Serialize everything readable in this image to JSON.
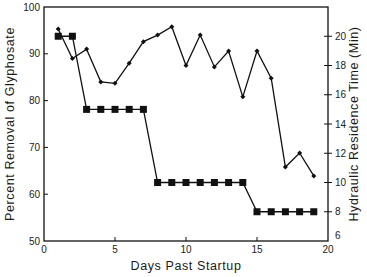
{
  "chart_data": {
    "type": "line",
    "title": "",
    "xlabel": "Days Past Startup",
    "ylabel": "Percent Removal of Glyphosate",
    "y2label": "Hydraulic Residence Time (Min)",
    "xlim": [
      0,
      20
    ],
    "ylim": [
      50,
      100
    ],
    "y2lim": [
      6,
      22
    ],
    "x_ticks": [
      0,
      5,
      10,
      15,
      20
    ],
    "y_ticks": [
      50,
      60,
      70,
      80,
      90,
      100
    ],
    "y2_ticks": [
      6,
      8,
      10,
      12,
      14,
      16,
      18,
      20
    ],
    "grid": false,
    "legend": null,
    "series": [
      {
        "name": "Percent Removal of Glyphosate",
        "axis": "left",
        "marker": "diamond",
        "x": [
          1,
          2,
          3,
          4,
          5,
          6,
          7,
          8,
          9,
          10,
          11,
          12,
          13,
          14,
          15,
          16,
          17,
          18,
          19
        ],
        "values": [
          95.3,
          89,
          91,
          84,
          83.7,
          88,
          92.6,
          94,
          95.8,
          87.5,
          94,
          87.2,
          90.6,
          80.8,
          90.6,
          84.8,
          65.8,
          68.8,
          63.9
        ]
      },
      {
        "name": "Hydraulic Residence Time (Min)",
        "axis": "right",
        "marker": "square",
        "x": [
          1,
          2,
          3,
          4,
          5,
          6,
          7,
          8,
          9,
          10,
          11,
          12,
          13,
          14,
          15,
          16,
          17,
          18,
          19
        ],
        "values": [
          20,
          20,
          15,
          15,
          15,
          15,
          15,
          10,
          10,
          10,
          10,
          10,
          10,
          10,
          8,
          8,
          8,
          8,
          8
        ]
      }
    ]
  }
}
